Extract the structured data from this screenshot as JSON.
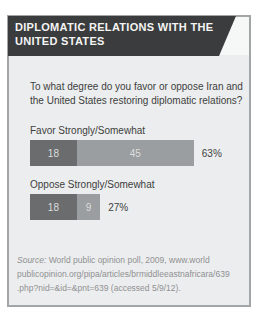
{
  "panel": {
    "header_bg": "#3a3c3d",
    "body_bg": "#ecedee",
    "border_color": "#a3a5a6",
    "title_line1": "DIPLOMATIC RELATIONS WITH THE",
    "title_line2": "UNITED STATES"
  },
  "question_lines": [
    "To what degree do you favor or oppose Iran and",
    "the United States restoring diplomatic relations?"
  ],
  "chart_data": {
    "type": "bar",
    "orientation": "horizontal",
    "stacked": true,
    "title": "DIPLOMATIC RELATIONS WITH THE UNITED STATES",
    "question": "To what degree do you favor or oppose Iran and the United States restoring diplomatic relations?",
    "categories": [
      "Favor Strongly/Somewhat",
      "Oppose Strongly/Somewhat"
    ],
    "series": [
      {
        "name": "Strongly",
        "values": [
          18,
          18
        ],
        "color": "#6a6c6d"
      },
      {
        "name": "Somewhat",
        "values": [
          45,
          9
        ],
        "color": "#9b9ea0"
      }
    ],
    "totals": [
      "63%",
      "27%"
    ],
    "unit": "percent",
    "xlim": [
      0,
      63
    ],
    "scale_px_per_unit": 2.6,
    "grid": false,
    "legend": false
  },
  "source": {
    "prefix_italic": "Source:",
    "line1_rest": " World public opinion poll, 2009, www.world",
    "line2": "publicopinion.org/pipa/articles/brmiddleeastnafricara/639",
    "line3": ".php?nid=&id=&pnt=639 (accessed 5/9/12)."
  }
}
